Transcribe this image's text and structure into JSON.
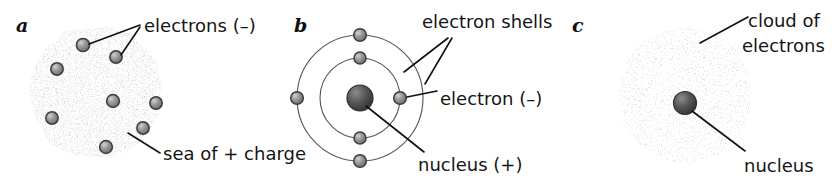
{
  "figure": {
    "background_color": "#ffffff",
    "ink_color": "#151515",
    "speckle_color": "#a8a8a8",
    "sphere_color": "#8d8d8d",
    "nucleus_color": "#4a4a4a",
    "shell_color": "#5a5a5a"
  },
  "panels": [
    {
      "letter": "a",
      "model": "plum-pudding",
      "labels": [
        {
          "text": "electrons (–)"
        },
        {
          "text": "sea of + charge"
        }
      ],
      "electron_count": 8
    },
    {
      "letter": "b",
      "model": "bohr-shells",
      "labels": [
        {
          "text": "electron shells"
        },
        {
          "text": "electron (–)"
        },
        {
          "text": "nucleus (+)"
        }
      ],
      "shell_count": 2,
      "electron_count": 6
    },
    {
      "letter": "c",
      "model": "electron-cloud",
      "labels": [
        {
          "text": "cloud of"
        },
        {
          "text": "electrons"
        },
        {
          "text": "nucleus"
        }
      ]
    }
  ]
}
